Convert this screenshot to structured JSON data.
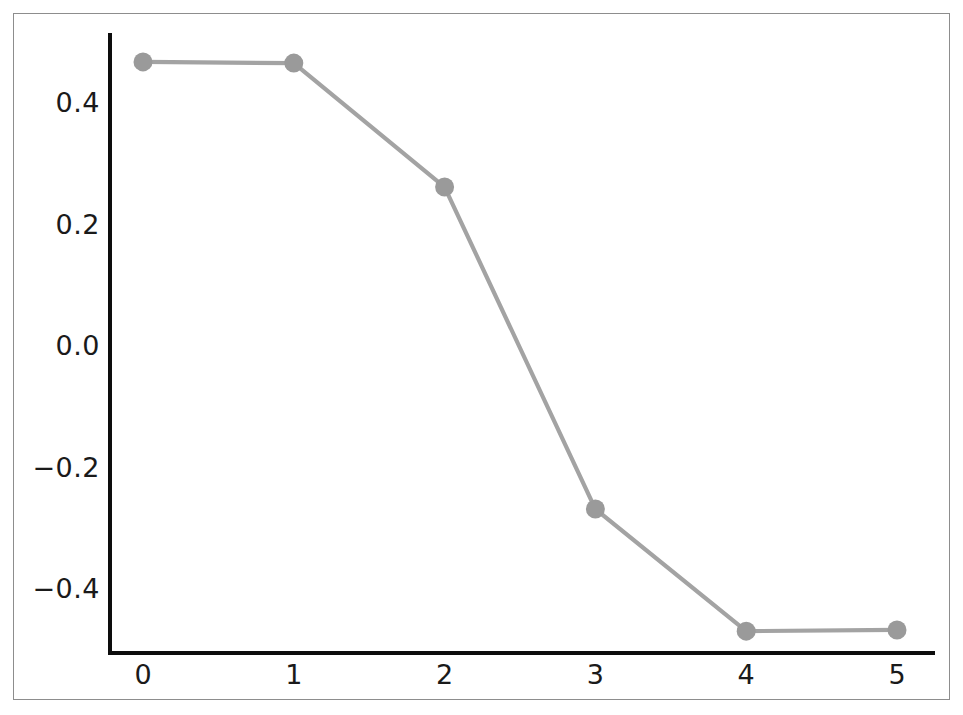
{
  "chart_data": {
    "type": "line",
    "title": "",
    "subtitle": "",
    "xlabel": "",
    "ylabel": "",
    "x": [
      0,
      1,
      2,
      3,
      4,
      5
    ],
    "values": [
      0.466,
      0.464,
      0.26,
      -0.27,
      -0.471,
      -0.469
    ],
    "series": [
      {
        "name": "",
        "x": [
          0,
          1,
          2,
          3,
          4,
          5
        ],
        "values": [
          0.466,
          0.464,
          0.26,
          -0.27,
          -0.471,
          -0.469
        ]
      }
    ],
    "xlim": [
      -0.23,
      5.23
    ],
    "ylim": [
      -0.513,
      0.513
    ],
    "xticks": [
      0,
      1,
      2,
      3,
      4,
      5
    ],
    "xtick_labels": [
      "0",
      "1",
      "2",
      "3",
      "4",
      "5"
    ],
    "yticks": [
      0.4,
      0.2,
      0.0,
      -0.2,
      -0.4
    ],
    "ytick_labels": [
      "0.4",
      "0.2",
      "0.0",
      "−0.2",
      "−0.4"
    ],
    "grid": false,
    "legend": false,
    "legend_position": "none",
    "marker": "circle",
    "line_color": "#a3a3a3",
    "marker_color": "#9a9a9a",
    "axis_color": "#0d0d0d",
    "frame_color": "#8d8d8d",
    "background_color": "#ffffff",
    "annotations": []
  }
}
